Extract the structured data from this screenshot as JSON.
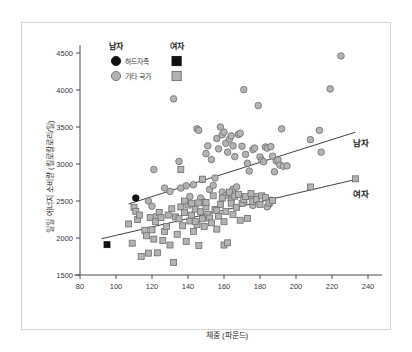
{
  "figure": {
    "border_color": "#d6d6d6",
    "background": "#ffffff"
  },
  "legend": {
    "header_male": "남자",
    "header_female": "여자",
    "rows": [
      {
        "label": "하드자족",
        "male_marker": "filled-circle-black",
        "female_marker": "filled-square-black"
      },
      {
        "label": "기타 국가",
        "male_marker": "filled-circle-gray",
        "female_marker": "filled-square-gray"
      }
    ]
  },
  "series_labels": {
    "male": "남자",
    "female": "여자"
  },
  "colors": {
    "marker_gray_fill": "#b3b3b3",
    "marker_gray_stroke": "#6e6e6e",
    "marker_black": "#111111",
    "trend_line": "#2b2b2b",
    "axis": "#4a4a4a",
    "text": "#303030"
  },
  "chart_data": {
    "type": "scatter",
    "title": "",
    "xlabel": "체중 (파운드)",
    "ylabel": "일일 에너지 소비량 (킬로칼로리/일)",
    "xlim": [
      80,
      240
    ],
    "ylim": [
      1500,
      4500
    ],
    "xticks": [
      80,
      100,
      120,
      140,
      160,
      180,
      200,
      220,
      240
    ],
    "yticks": [
      1500,
      2000,
      2500,
      3000,
      3500,
      4000,
      4500
    ],
    "grid": false,
    "legend_position": "top-left-inside",
    "series": [
      {
        "name": "남자 - 기타 국가",
        "marker": "circle",
        "fill": "#b3b3b3",
        "stroke": "#6e6e6e",
        "points": [
          [
            121,
            2925
          ],
          [
            132,
            3880
          ],
          [
            135,
            3035
          ],
          [
            139,
            2705
          ],
          [
            143,
            2720
          ],
          [
            145,
            3475
          ],
          [
            146,
            3455
          ],
          [
            148,
            2790
          ],
          [
            150,
            3140
          ],
          [
            151,
            3245
          ],
          [
            152,
            2655
          ],
          [
            153,
            3060
          ],
          [
            154,
            2710
          ],
          [
            155,
            2810
          ],
          [
            156,
            3345
          ],
          [
            157,
            3205
          ],
          [
            158,
            3500
          ],
          [
            159,
            3395
          ],
          [
            159,
            2620
          ],
          [
            160,
            3430
          ],
          [
            161,
            3280
          ],
          [
            161,
            2575
          ],
          [
            162,
            3160
          ],
          [
            163,
            3335
          ],
          [
            163,
            2605
          ],
          [
            164,
            3380
          ],
          [
            165,
            3245
          ],
          [
            165,
            2660
          ],
          [
            166,
            3100
          ],
          [
            167,
            2690
          ],
          [
            168,
            3400
          ],
          [
            169,
            3415
          ],
          [
            170,
            3240
          ],
          [
            171,
            4005
          ],
          [
            171,
            2480
          ],
          [
            172,
            3130
          ],
          [
            173,
            3010
          ],
          [
            174,
            2905
          ],
          [
            175,
            2570
          ],
          [
            176,
            3195
          ],
          [
            177,
            3215
          ],
          [
            178,
            2560
          ],
          [
            179,
            3790
          ],
          [
            180,
            3095
          ],
          [
            181,
            3050
          ],
          [
            182,
            3030
          ],
          [
            183,
            3230
          ],
          [
            184,
            3215
          ],
          [
            185,
            2455
          ],
          [
            186,
            3235
          ],
          [
            187,
            3105
          ],
          [
            188,
            2895
          ],
          [
            189,
            3040
          ],
          [
            190,
            3055
          ],
          [
            191,
            2985
          ],
          [
            192,
            3475
          ],
          [
            193,
            2970
          ],
          [
            195,
            2975
          ],
          [
            208,
            3330
          ],
          [
            213,
            3455
          ],
          [
            214,
            3160
          ],
          [
            219,
            4015
          ],
          [
            225,
            4460
          ],
          [
            118,
            2500
          ],
          [
            120,
            2430
          ],
          [
            122,
            2290
          ],
          [
            127,
            2675
          ],
          [
            130,
            2630
          ],
          [
            136,
            2675
          ],
          [
            141,
            2560
          ],
          [
            147,
            2540
          ],
          [
            149,
            2485
          ],
          [
            164,
            2510
          ],
          [
            176,
            2440
          ],
          [
            184,
            2420
          ],
          [
            186,
            2510
          ]
        ]
      },
      {
        "name": "여자 - 기타 국가",
        "marker": "square",
        "fill": "#b3b3b3",
        "stroke": "#6e6e6e",
        "points": [
          [
            107,
            2190
          ],
          [
            109,
            1930
          ],
          [
            110,
            2415
          ],
          [
            111,
            2360
          ],
          [
            112,
            2250
          ],
          [
            113,
            2310
          ],
          [
            114,
            1750
          ],
          [
            116,
            2105
          ],
          [
            117,
            2030
          ],
          [
            118,
            1795
          ],
          [
            119,
            2275
          ],
          [
            120,
            2110
          ],
          [
            121,
            1985
          ],
          [
            122,
            2220
          ],
          [
            123,
            1800
          ],
          [
            124,
            2345
          ],
          [
            125,
            2275
          ],
          [
            126,
            1965
          ],
          [
            127,
            2090
          ],
          [
            128,
            2155
          ],
          [
            129,
            2310
          ],
          [
            130,
            1905
          ],
          [
            131,
            2395
          ],
          [
            132,
            1670
          ],
          [
            133,
            2285
          ],
          [
            134,
            2050
          ],
          [
            135,
            2260
          ],
          [
            136,
            2925
          ],
          [
            136,
            2420
          ],
          [
            137,
            2165
          ],
          [
            138,
            2345
          ],
          [
            139,
            1955
          ],
          [
            140,
            2445
          ],
          [
            141,
            2230
          ],
          [
            142,
            2310
          ],
          [
            143,
            2090
          ],
          [
            144,
            2390
          ],
          [
            145,
            2180
          ],
          [
            146,
            2475
          ],
          [
            146,
            1900
          ],
          [
            147,
            2355
          ],
          [
            148,
            2260
          ],
          [
            148,
            2795
          ],
          [
            149,
            2155
          ],
          [
            150,
            2420
          ],
          [
            151,
            2320
          ],
          [
            152,
            2270
          ],
          [
            153,
            2205
          ],
          [
            154,
            2570
          ],
          [
            155,
            2385
          ],
          [
            156,
            2120
          ],
          [
            157,
            2295
          ],
          [
            158,
            2455
          ],
          [
            159,
            2540
          ],
          [
            160,
            2220
          ],
          [
            160,
            1905
          ],
          [
            161,
            2360
          ],
          [
            162,
            1935
          ],
          [
            163,
            2620
          ],
          [
            164,
            2470
          ],
          [
            165,
            2315
          ],
          [
            166,
            2565
          ],
          [
            167,
            2415
          ],
          [
            168,
            2590
          ],
          [
            169,
            2240
          ],
          [
            170,
            2470
          ],
          [
            171,
            2520
          ],
          [
            172,
            2560
          ],
          [
            173,
            2265
          ],
          [
            175,
            2600
          ],
          [
            176,
            2495
          ],
          [
            178,
            2520
          ],
          [
            180,
            2455
          ],
          [
            181,
            2570
          ],
          [
            183,
            2545
          ],
          [
            185,
            2475
          ],
          [
            187,
            2505
          ],
          [
            208,
            2690
          ],
          [
            233,
            2800
          ],
          [
            142,
            2470
          ],
          [
            144,
            2225
          ],
          [
            138,
            2500
          ],
          [
            150,
            2480
          ],
          [
            156,
            2375
          ]
        ]
      },
      {
        "name": "남자 - 하드자족",
        "marker": "circle",
        "fill": "#111111",
        "stroke": "#111111",
        "points": [
          [
            111,
            2540
          ]
        ]
      },
      {
        "name": "여자 - 하드자족",
        "marker": "square",
        "fill": "#111111",
        "stroke": "#111111",
        "points": [
          [
            95,
            1910
          ]
        ]
      }
    ],
    "trend_lines": [
      {
        "name": "남자",
        "x": [
          107,
          233
        ],
        "y": [
          2460,
          3430
        ]
      },
      {
        "name": "여자",
        "x": [
          92,
          233
        ],
        "y": [
          1990,
          2790
        ]
      }
    ]
  }
}
